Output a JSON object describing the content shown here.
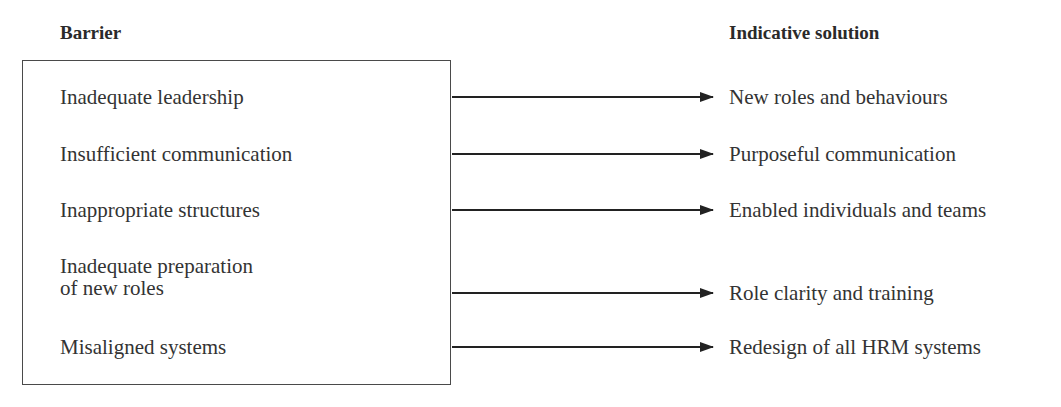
{
  "headers": {
    "barrier": "Barrier",
    "solution": "Indicative solution"
  },
  "rows": [
    {
      "barrier": [
        "Inadequate leadership"
      ],
      "solution": "New roles and behaviours",
      "y": 97
    },
    {
      "barrier": [
        "Insufficient communication"
      ],
      "solution": "Purposeful communication",
      "y": 154
    },
    {
      "barrier": [
        "Inappropriate structures"
      ],
      "solution": "Enabled individuals and teams",
      "y": 210
    },
    {
      "barrier": [
        "Inadequate preparation",
        "of new roles"
      ],
      "solution": "Role clarity and training",
      "y": 294
    },
    {
      "barrier": [
        "Misaligned systems"
      ],
      "solution": "Redesign of all HRM systems",
      "y": 347
    }
  ],
  "colors": {
    "text": "#2a2a2a",
    "lines": "#222222",
    "background": "#ffffff"
  }
}
